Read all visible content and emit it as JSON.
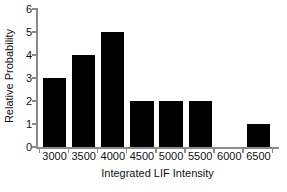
{
  "chart_data": {
    "type": "bar",
    "title": "",
    "xlabel": "Integrated LIF Intensity",
    "ylabel": "Relative Probability",
    "categories": [
      "3000",
      "3500",
      "4000",
      "4500",
      "5000",
      "5500",
      "6000",
      "6500"
    ],
    "values": [
      3,
      4,
      5,
      2,
      2,
      2,
      0,
      1
    ],
    "ylim": [
      0,
      6
    ],
    "yticks": [
      "0",
      "1",
      "2",
      "3",
      "4",
      "5",
      "6"
    ],
    "ytick_values": [
      0,
      1,
      2,
      3,
      4,
      5,
      6
    ],
    "grid": false,
    "legend": null,
    "bar_color": "#000000",
    "axis_color": "#8a8a8a",
    "text_color": "#111111",
    "background": "#ffffff"
  }
}
